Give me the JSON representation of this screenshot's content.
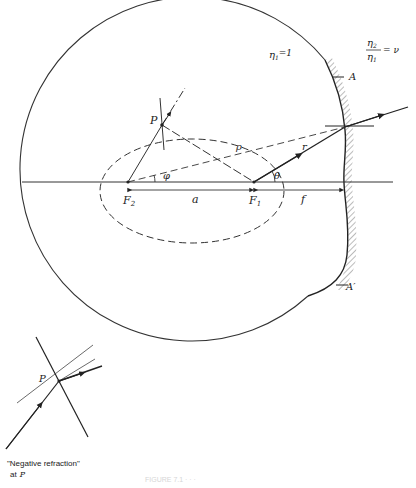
{
  "diagram": {
    "labels": {
      "point_P": "P",
      "focus_1": "F",
      "focus_1_sub": "1",
      "focus_2": "F",
      "focus_2_sub": "2",
      "distance_a": "a",
      "distance_f": "f",
      "radius_r": "r",
      "distance_rho": "ρ",
      "angle_phi": "φ",
      "angle_theta": "θ",
      "point_A": "A",
      "point_A_prime": "A′",
      "eta1": "η",
      "eta1_sub": "1",
      "eta1_value": "=1",
      "ratio_num": "η",
      "ratio_num_sub": "2",
      "ratio_den": "η",
      "ratio_den_sub": "1",
      "ratio_value": "= ν"
    },
    "inset": {
      "point_label": "P",
      "caption_line1": "\"Negative refraction\"",
      "caption_line2": "at",
      "caption_point": "P"
    },
    "figure_caption": "FIGURE 7.1  ·  ·  ·"
  }
}
